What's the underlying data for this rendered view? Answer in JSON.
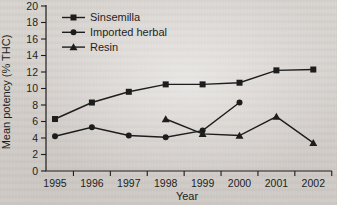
{
  "figure": {
    "background_color": "#d9d5d1",
    "ink_color": "#1d1d1d"
  },
  "chart_data": {
    "type": "line",
    "title": "",
    "xlabel": "Year",
    "ylabel": "Mean potency (% THC)",
    "categories": [
      "1995",
      "1996",
      "1997",
      "1998",
      "1999",
      "2000",
      "2001",
      "2002"
    ],
    "ylim": [
      0,
      20
    ],
    "ytick_step": 2,
    "yticks": [
      0,
      2,
      4,
      6,
      8,
      10,
      12,
      14,
      16,
      18,
      20
    ],
    "grid": false,
    "legend_position": "top-left-inside",
    "series": [
      {
        "name": "Sinsemilla",
        "marker": "square",
        "values": [
          6.3,
          8.3,
          9.6,
          10.5,
          10.5,
          10.7,
          12.2,
          12.3
        ]
      },
      {
        "name": "Imported herbal",
        "marker": "circle",
        "values": [
          4.2,
          5.3,
          4.3,
          4.1,
          4.9,
          8.3,
          null,
          null
        ]
      },
      {
        "name": "Resin",
        "marker": "triangle",
        "values": [
          null,
          null,
          null,
          6.3,
          4.5,
          4.3,
          6.6,
          3.4
        ]
      }
    ]
  }
}
